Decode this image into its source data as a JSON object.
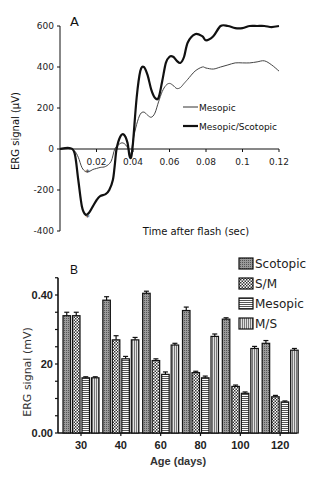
{
  "chart_data": [
    {
      "panel": "A",
      "type": "line",
      "title": "A",
      "xlabel": "Time after flash (sec)",
      "ylabel": "ERG signal (µV)",
      "xlim": [
        0,
        0.12
      ],
      "ylim": [
        -400,
        600
      ],
      "xticks": [
        0.02,
        0.04,
        0.06,
        0.08,
        0.1,
        0.12
      ],
      "xtick_labels": [
        "0.02",
        "0.04",
        "0.06",
        "0.08",
        "0.1",
        "0.12"
      ],
      "yticks": [
        -400,
        -200,
        0,
        200,
        400,
        600
      ],
      "ytick_labels": [
        "-400",
        "-200",
        "0",
        "200",
        "400",
        "600"
      ],
      "grid": false,
      "legend_position": "right-middle",
      "annotations": [
        {
          "text": "*",
          "x": 0.015,
          "y": -130
        },
        {
          "text": "*",
          "x": 0.015,
          "y": -350
        }
      ],
      "series": [
        {
          "name": "Mesopic",
          "line_width": 1,
          "x": [
            0,
            0.005,
            0.008,
            0.01,
            0.012,
            0.014,
            0.016,
            0.018,
            0.02,
            0.022,
            0.025,
            0.028,
            0.03,
            0.032,
            0.034,
            0.036,
            0.038,
            0.039,
            0.04,
            0.042,
            0.044,
            0.046,
            0.048,
            0.05,
            0.052,
            0.054,
            0.056,
            0.058,
            0.06,
            0.062,
            0.064,
            0.066,
            0.068,
            0.07,
            0.074,
            0.078,
            0.08,
            0.084,
            0.088,
            0.092,
            0.096,
            0.1,
            0.104,
            0.108,
            0.112,
            0.116,
            0.12
          ],
          "y": [
            0,
            5,
            -10,
            -40,
            -90,
            -110,
            -110,
            -100,
            -95,
            -90,
            -85,
            -60,
            0,
            20,
            30,
            20,
            -10,
            -30,
            40,
            120,
            170,
            180,
            165,
            155,
            175,
            230,
            280,
            310,
            320,
            310,
            295,
            300,
            320,
            340,
            380,
            400,
            395,
            390,
            400,
            410,
            420,
            420,
            420,
            425,
            430,
            410,
            380
          ]
        },
        {
          "name": "Mesopic/Scotopic",
          "line_width": 2.2,
          "x": [
            0,
            0.005,
            0.008,
            0.01,
            0.012,
            0.014,
            0.016,
            0.018,
            0.02,
            0.022,
            0.025,
            0.027,
            0.029,
            0.03,
            0.031,
            0.033,
            0.035,
            0.037,
            0.038,
            0.039,
            0.04,
            0.042,
            0.044,
            0.046,
            0.048,
            0.05,
            0.052,
            0.054,
            0.056,
            0.058,
            0.06,
            0.062,
            0.064,
            0.066,
            0.068,
            0.07,
            0.074,
            0.078,
            0.08,
            0.084,
            0.088,
            0.092,
            0.096,
            0.1,
            0.104,
            0.108,
            0.112,
            0.116,
            0.12
          ],
          "y": [
            0,
            5,
            -20,
            -150,
            -280,
            -320,
            -310,
            -280,
            -250,
            -230,
            -220,
            -200,
            -150,
            -80,
            0,
            60,
            70,
            30,
            -30,
            -40,
            30,
            250,
            380,
            400,
            360,
            290,
            250,
            250,
            330,
            420,
            450,
            450,
            430,
            420,
            450,
            520,
            560,
            550,
            530,
            550,
            600,
            600,
            590,
            590,
            600,
            600,
            600,
            595,
            600
          ]
        }
      ]
    },
    {
      "panel": "B",
      "type": "bar",
      "title": "B",
      "xlabel": "Age (days)",
      "ylabel": "ERG signal (mV)",
      "categories": [
        "30",
        "40",
        "60",
        "80",
        "100",
        "120"
      ],
      "ylim": [
        0,
        0.45
      ],
      "yticks": [
        0.0,
        0.2,
        0.4
      ],
      "ytick_labels": [
        "0.00",
        "20",
        "0.40"
      ],
      "grid": false,
      "legend_position": "top-right",
      "series": [
        {
          "name": "Scotopic",
          "pattern": "dense-dots",
          "values": [
            0.34,
            0.385,
            0.405,
            0.355,
            0.33,
            0.26
          ],
          "errors": [
            0.01,
            0.01,
            0.006,
            0.01,
            0.004,
            0.008
          ]
        },
        {
          "name": "S/M",
          "pattern": "checker",
          "values": [
            0.34,
            0.27,
            0.21,
            0.175,
            0.135,
            0.105
          ],
          "errors": [
            0.01,
            0.012,
            0.005,
            0.004,
            0.004,
            0.004
          ]
        },
        {
          "name": "Mesopic",
          "pattern": "horizontal-lines",
          "values": [
            0.16,
            0.215,
            0.17,
            0.16,
            0.115,
            0.09
          ],
          "errors": [
            0.003,
            0.007,
            0.007,
            0.005,
            0.004,
            0.003
          ]
        },
        {
          "name": "M/S",
          "pattern": "vertical-lines",
          "values": [
            0.16,
            0.27,
            0.255,
            0.28,
            0.245,
            0.24
          ],
          "errors": [
            0.003,
            0.007,
            0.005,
            0.007,
            0.006,
            0.005
          ]
        }
      ]
    }
  ],
  "panelA": {
    "label": "A",
    "xlabel": "Time after flash (sec)",
    "ylabel": "ERG signal (µV)",
    "legend": [
      "Mesopic",
      "Mesopic/Scotopic"
    ]
  },
  "panelB": {
    "label": "B",
    "xlabel": "Age (days)",
    "ylabel": "ERG signal (mV)",
    "legend": [
      "Scotopic",
      "S/M",
      "Mesopic",
      "M/S"
    ]
  }
}
